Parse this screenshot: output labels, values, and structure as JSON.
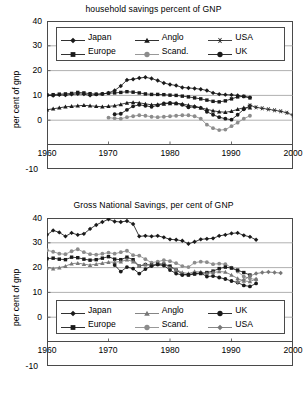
{
  "charts": [
    {
      "id": "household-savings",
      "title": "household savings percent of GNP",
      "ylabel": "per cent of gnp",
      "yticks": [
        "40",
        "30",
        "20",
        "10",
        "0",
        "-10"
      ],
      "xticks": [
        "1960",
        "1970",
        "1980",
        "1990",
        "2000"
      ],
      "legend": [
        {
          "label": "Japan",
          "marker": "diamond",
          "color": "#1a1a1a"
        },
        {
          "label": "Anglo",
          "marker": "triangle",
          "color": "#1a1a1a"
        },
        {
          "label": "USA",
          "marker": "asterisk",
          "color": "#2b2b2b"
        },
        {
          "label": "Europe",
          "marker": "square",
          "color": "#1a1a1a"
        },
        {
          "label": "Scand.",
          "marker": "circle",
          "color": "#8c8c8c"
        },
        {
          "label": "UK",
          "marker": "circle",
          "color": "#1a1a1a"
        }
      ]
    },
    {
      "id": "gross-national-savings",
      "title": "Gross National Savings, per cent of GNP",
      "ylabel": "per cent of gnp",
      "yticks": [
        "40",
        "30",
        "20",
        "10",
        "0",
        "-10"
      ],
      "xticks": [
        "1960",
        "1970",
        "1980",
        "1990",
        "2000"
      ],
      "legend": [
        {
          "label": "Japan",
          "marker": "diamond",
          "color": "#1a1a1a"
        },
        {
          "label": "Anglo",
          "marker": "triangle",
          "color": "#777777"
        },
        {
          "label": "UK",
          "marker": "circle",
          "color": "#1a1a1a"
        },
        {
          "label": "Europe",
          "marker": "square",
          "color": "#1a1a1a"
        },
        {
          "label": "Scand.",
          "marker": "circle",
          "color": "#8c8c8c"
        },
        {
          "label": "USA",
          "marker": "diamond",
          "color": "#777777"
        }
      ]
    }
  ],
  "chart_data": [
    {
      "type": "line",
      "title": "household savings percent of GNP",
      "xlabel": "",
      "ylabel": "per cent of gnp",
      "xlim": [
        1960,
        2000
      ],
      "ylim": [
        -10,
        40
      ],
      "yticks": [
        -10,
        0,
        10,
        20,
        30,
        40
      ],
      "xticks": [
        1960,
        1970,
        1980,
        1990,
        2000
      ],
      "grid": "horizontal",
      "legend_position": "top-inside",
      "series": [
        {
          "name": "Japan",
          "marker": "diamond",
          "color": "#1a1a1a",
          "x": [
            1960,
            1961,
            1962,
            1963,
            1964,
            1965,
            1966,
            1967,
            1968,
            1969,
            1970,
            1971,
            1972,
            1973,
            1974,
            1975,
            1976,
            1977,
            1978,
            1979,
            1980,
            1981,
            1982,
            1983,
            1984,
            1985,
            1986,
            1987,
            1988,
            1989,
            1990,
            1991,
            1992,
            1993
          ],
          "values": [
            10.0,
            9.9,
            10.2,
            10.1,
            10.4,
            10.6,
            10.5,
            10.0,
            10.4,
            10.6,
            11.0,
            12.0,
            13.8,
            16.2,
            16.5,
            17.0,
            17.3,
            16.8,
            16.0,
            15.0,
            14.4,
            14.0,
            13.2,
            13.0,
            12.8,
            12.5,
            12.0,
            11.0,
            10.5,
            10.3,
            10.2,
            10.0,
            9.6,
            9.2
          ]
        },
        {
          "name": "Europe",
          "marker": "square",
          "color": "#1a1a1a",
          "x": [
            1960,
            1961,
            1962,
            1963,
            1964,
            1965,
            1966,
            1967,
            1968,
            1969,
            1970,
            1971,
            1972,
            1973,
            1974,
            1975,
            1976,
            1977,
            1978,
            1979,
            1980,
            1981,
            1982,
            1983,
            1984,
            1985,
            1986,
            1987,
            1988,
            1989,
            1990,
            1991,
            1992,
            1993
          ],
          "values": [
            10.2,
            10.3,
            10.5,
            10.6,
            10.8,
            11.2,
            11.0,
            10.7,
            10.5,
            10.6,
            10.9,
            11.0,
            11.2,
            11.5,
            11.3,
            11.0,
            10.6,
            10.4,
            10.4,
            10.3,
            10.1,
            10.0,
            9.7,
            9.4,
            9.0,
            8.6,
            8.1,
            7.6,
            7.4,
            7.8,
            8.6,
            9.4,
            9.6,
            9.0
          ]
        },
        {
          "name": "Anglo",
          "marker": "triangle",
          "color": "#1a1a1a",
          "x": [
            1960,
            1961,
            1962,
            1963,
            1964,
            1965,
            1966,
            1967,
            1968,
            1969,
            1970,
            1971,
            1972,
            1973,
            1974,
            1975,
            1976,
            1977,
            1978,
            1979,
            1980,
            1981,
            1982,
            1983,
            1984,
            1985,
            1986,
            1987,
            1988,
            1989,
            1990,
            1991,
            1992,
            1993
          ],
          "values": [
            4.2,
            4.6,
            5.0,
            5.4,
            5.6,
            5.8,
            6.0,
            5.8,
            5.6,
            5.4,
            5.6,
            5.8,
            6.4,
            7.0,
            7.2,
            7.0,
            6.6,
            6.2,
            6.4,
            6.6,
            6.8,
            6.8,
            6.6,
            6.0,
            5.6,
            5.0,
            4.4,
            3.8,
            3.4,
            3.2,
            3.6,
            4.4,
            5.0,
            5.0
          ]
        },
        {
          "name": "UK",
          "marker": "circle",
          "color": "#1a1a1a",
          "x": [
            1971,
            1972,
            1973,
            1974,
            1975,
            1976,
            1977,
            1978,
            1979,
            1980,
            1981,
            1982,
            1983,
            1984,
            1985,
            1986,
            1987,
            1988,
            1989,
            1990,
            1991,
            1992,
            1993
          ],
          "values": [
            2.4,
            2.6,
            4.2,
            5.6,
            6.2,
            5.8,
            5.4,
            6.0,
            6.8,
            7.0,
            6.8,
            6.2,
            5.2,
            5.4,
            5.0,
            3.4,
            2.2,
            1.2,
            0.6,
            0.2,
            2.2,
            4.4,
            5.8
          ]
        },
        {
          "name": "Scand.",
          "marker": "circle",
          "color": "#8c8c8c",
          "x": [
            1970,
            1971,
            1972,
            1973,
            1974,
            1975,
            1976,
            1977,
            1978,
            1979,
            1980,
            1981,
            1982,
            1983,
            1984,
            1985,
            1986,
            1987,
            1988,
            1989,
            1990,
            1991,
            1992,
            1993
          ],
          "values": [
            1.0,
            0.8,
            0.6,
            1.2,
            1.6,
            2.0,
            1.8,
            1.4,
            1.2,
            1.4,
            1.6,
            1.8,
            2.0,
            2.0,
            1.6,
            0.6,
            -1.8,
            -3.2,
            -4.0,
            -3.8,
            -2.4,
            -1.0,
            0.6,
            1.8
          ]
        },
        {
          "name": "USA",
          "marker": "asterisk",
          "color": "#2b2b2b",
          "x": [
            1993,
            1994,
            1995,
            1996,
            1997,
            1998,
            1999,
            2000
          ],
          "values": [
            6.0,
            5.2,
            4.8,
            4.4,
            4.0,
            3.6,
            3.0,
            2.0
          ]
        }
      ]
    },
    {
      "type": "line",
      "title": "Gross National Savings, per cent of GNP",
      "xlabel": "",
      "ylabel": "per cent of gnp",
      "xlim": [
        1960,
        2000
      ],
      "ylim": [
        -10,
        40
      ],
      "yticks": [
        -10,
        0,
        10,
        20,
        30,
        40
      ],
      "xticks": [
        1960,
        1970,
        1980,
        1990,
        2000
      ],
      "grid": "horizontal",
      "legend_position": "bottom-inside",
      "series": [
        {
          "name": "Japan",
          "marker": "diamond",
          "color": "#1a1a1a",
          "x": [
            1960,
            1961,
            1962,
            1963,
            1964,
            1965,
            1966,
            1967,
            1968,
            1969,
            1970,
            1971,
            1972,
            1973,
            1974,
            1975,
            1976,
            1977,
            1978,
            1979,
            1980,
            1981,
            1982,
            1983,
            1984,
            1985,
            1986,
            1987,
            1988,
            1989,
            1990,
            1991,
            1992,
            1993,
            1994
          ],
          "values": [
            33.2,
            35.0,
            34.2,
            32.6,
            34.0,
            33.2,
            33.6,
            35.6,
            37.2,
            38.4,
            39.5,
            38.6,
            38.4,
            38.8,
            37.6,
            32.6,
            32.8,
            32.6,
            32.8,
            32.2,
            31.4,
            31.2,
            30.8,
            29.6,
            30.4,
            31.4,
            31.6,
            31.8,
            32.8,
            33.2,
            33.8,
            34.0,
            33.0,
            32.4,
            31.2
          ]
        },
        {
          "name": "Scand.",
          "marker": "circle",
          "color": "#8c8c8c",
          "x": [
            1960,
            1961,
            1962,
            1963,
            1964,
            1965,
            1966,
            1967,
            1968,
            1969,
            1970,
            1971,
            1972,
            1973,
            1974,
            1975,
            1976,
            1977,
            1978,
            1979,
            1980,
            1981,
            1982,
            1983,
            1984,
            1985,
            1986,
            1987,
            1988,
            1989,
            1990,
            1991,
            1992,
            1993,
            1994
          ],
          "values": [
            27.0,
            26.4,
            25.6,
            25.4,
            26.6,
            27.4,
            26.2,
            25.4,
            25.2,
            25.6,
            26.0,
            25.6,
            26.2,
            26.8,
            25.0,
            24.8,
            23.4,
            22.0,
            22.4,
            23.0,
            22.6,
            21.8,
            20.6,
            20.2,
            22.0,
            22.4,
            22.2,
            21.4,
            21.6,
            21.4,
            20.0,
            18.4,
            16.4,
            15.6,
            15.2
          ]
        },
        {
          "name": "Europe",
          "marker": "square",
          "color": "#1a1a1a",
          "x": [
            1960,
            1961,
            1962,
            1963,
            1964,
            1965,
            1966,
            1967,
            1968,
            1969,
            1970,
            1971,
            1972,
            1973,
            1974,
            1975,
            1976,
            1977,
            1978,
            1979,
            1980,
            1981,
            1982,
            1983,
            1984,
            1985,
            1986,
            1987,
            1988,
            1989,
            1990,
            1991,
            1992,
            1993
          ],
          "values": [
            23.6,
            23.8,
            23.4,
            23.2,
            24.2,
            24.0,
            23.4,
            23.0,
            23.2,
            23.8,
            24.4,
            23.4,
            23.2,
            24.2,
            23.2,
            20.6,
            21.2,
            21.0,
            21.4,
            21.4,
            20.6,
            19.0,
            17.4,
            17.0,
            17.4,
            17.6,
            18.0,
            18.6,
            19.6,
            20.2,
            19.8,
            19.0,
            18.0,
            17.0
          ]
        },
        {
          "name": "Anglo",
          "marker": "triangle",
          "color": "#777777",
          "x": [
            1960,
            1961,
            1962,
            1963,
            1964,
            1965,
            1966,
            1967,
            1968,
            1969,
            1970,
            1971,
            1972,
            1973,
            1974,
            1975,
            1976,
            1977,
            1978,
            1979,
            1980,
            1981,
            1982,
            1983,
            1984,
            1985,
            1986,
            1987,
            1988,
            1989,
            1990,
            1991,
            1992,
            1993,
            1994
          ],
          "values": [
            20.0,
            19.6,
            20.0,
            20.6,
            21.6,
            21.8,
            21.4,
            21.0,
            21.4,
            21.8,
            22.2,
            22.2,
            22.4,
            23.2,
            22.4,
            20.6,
            21.4,
            21.0,
            21.6,
            21.4,
            20.0,
            19.2,
            18.0,
            17.6,
            18.4,
            18.2,
            17.6,
            18.0,
            18.4,
            18.2,
            17.0,
            15.6,
            14.6,
            14.4,
            15.4
          ]
        },
        {
          "name": "UK",
          "marker": "circle",
          "color": "#1a1a1a",
          "x": [
            1971,
            1972,
            1973,
            1974,
            1975,
            1976,
            1977,
            1978,
            1979,
            1980,
            1981,
            1982,
            1983,
            1984,
            1985,
            1986,
            1987,
            1988,
            1989,
            1990,
            1991,
            1992,
            1993,
            1994
          ],
          "values": [
            21.0,
            18.4,
            20.2,
            19.6,
            17.6,
            19.4,
            20.6,
            21.2,
            20.8,
            19.0,
            17.6,
            17.0,
            17.2,
            17.6,
            17.8,
            16.4,
            16.6,
            16.0,
            15.4,
            14.6,
            14.0,
            12.8,
            12.4,
            13.6,
            13.4
          ]
        },
        {
          "name": "USA",
          "marker": "diamond",
          "color": "#777777",
          "x": [
            1991,
            1992,
            1993,
            1994,
            1995,
            1996,
            1997,
            1998
          ],
          "values": [
            14.2,
            15.0,
            16.6,
            17.6,
            18.0,
            18.2,
            18.0,
            17.8
          ]
        }
      ]
    }
  ]
}
